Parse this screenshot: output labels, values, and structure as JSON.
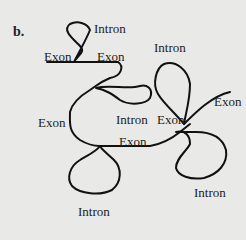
{
  "panel_label": "b.",
  "labels": [
    {
      "id": "intron-top",
      "text": "Intron",
      "x": 94,
      "y": 22
    },
    {
      "id": "exon-top-left",
      "text": "Exon",
      "x": 44,
      "y": 50
    },
    {
      "id": "exon-top-right",
      "text": "Exon",
      "x": 97,
      "y": 50
    },
    {
      "id": "intron-right-top",
      "text": "Intron",
      "x": 154,
      "y": 41
    },
    {
      "id": "exon-right",
      "text": "Exon",
      "x": 214,
      "y": 95
    },
    {
      "id": "exon-left-mid",
      "text": "Exon",
      "x": 38,
      "y": 116
    },
    {
      "id": "intron-mid",
      "text": "Intron",
      "x": 116,
      "y": 113
    },
    {
      "id": "exon-mid-right",
      "text": "Exon",
      "x": 157,
      "y": 113
    },
    {
      "id": "exon-mid-bottom",
      "text": "Exon",
      "x": 119,
      "y": 135
    },
    {
      "id": "intron-bottom-left",
      "text": "Intron",
      "x": 78,
      "y": 205
    },
    {
      "id": "intron-bottom-right",
      "text": "Intron",
      "x": 194,
      "y": 186
    }
  ],
  "colors": {
    "line": "#111111",
    "background": "#e9e9e7",
    "text": "#222222"
  }
}
